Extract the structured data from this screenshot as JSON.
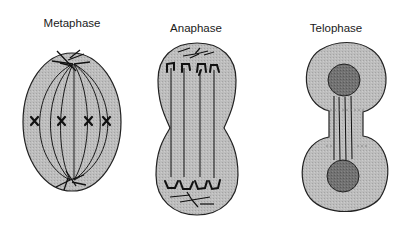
{
  "diagram": {
    "type": "cell-division-stages",
    "stages": [
      {
        "id": "metaphase",
        "label": "Metaphase",
        "label_pos": [
          72,
          24
        ],
        "description": "Oval cell with spindle fibers; four chromosomes (X shapes) aligned at equator",
        "chromosome_count": 4
      },
      {
        "id": "anaphase",
        "label": "Anaphase",
        "label_pos": [
          196,
          29
        ],
        "description": "Elongated cell pinching at middle; sister chromatids pulled to opposite poles along spindle fibers"
      },
      {
        "id": "telophase",
        "label": "Telophase",
        "label_pos": [
          336,
          29
        ],
        "description": "Cell nearly divided into two lobes, each with a dark nucleus; connected by a narrow bridge with remaining fibers"
      }
    ],
    "colors": {
      "cytoplasm": "#b9b9b9",
      "outline": "#222222",
      "nucleus": "#6e6e6e",
      "fiber": "#1a1a1a",
      "background": "#ffffff"
    }
  }
}
